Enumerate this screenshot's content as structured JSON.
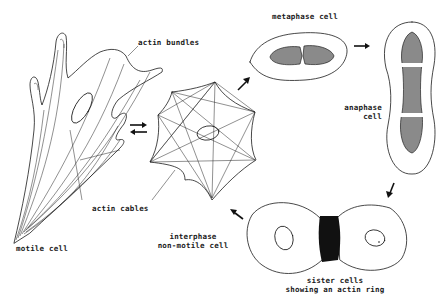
{
  "diagram": {
    "labels": {
      "actin_bundles": "actin bundles",
      "actin_cables": "actin cables",
      "motile_cell": "motile cell",
      "interphase_line1": "interphase",
      "interphase_line2": "non-motile cell",
      "metaphase_cell": "metaphase cell",
      "anaphase_line1": "anaphase",
      "anaphase_line2": "cell",
      "sister_line1": "sister cells",
      "sister_line2": "showing an actin ring"
    },
    "nodes": [
      {
        "id": "motile",
        "label": "motile cell"
      },
      {
        "id": "interphase",
        "label": "interphase non-motile cell"
      },
      {
        "id": "metaphase",
        "label": "metaphase cell"
      },
      {
        "id": "anaphase",
        "label": "anaphase cell"
      },
      {
        "id": "sister",
        "label": "sister cells showing an actin ring"
      }
    ],
    "edges": [
      {
        "from": "motile",
        "to": "interphase",
        "type": "reversible"
      },
      {
        "from": "interphase",
        "to": "metaphase"
      },
      {
        "from": "metaphase",
        "to": "anaphase"
      },
      {
        "from": "anaphase",
        "to": "sister"
      },
      {
        "from": "sister",
        "to": "interphase"
      }
    ]
  }
}
